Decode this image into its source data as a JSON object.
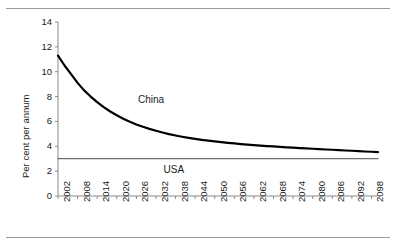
{
  "chart_data": {
    "type": "line",
    "title": "",
    "xlabel": "",
    "ylabel": "Per cent per annum",
    "xlim": [
      2002,
      2100
    ],
    "ylim": [
      0,
      14
    ],
    "yticks": [
      0,
      2,
      4,
      6,
      8,
      10,
      12,
      14
    ],
    "ytick_labels": [
      "0",
      "2",
      "4",
      "6",
      "8",
      "10",
      "12",
      "14"
    ],
    "xticks": [
      2002,
      2008,
      2014,
      2020,
      2026,
      2032,
      2038,
      2044,
      2050,
      2056,
      2062,
      2068,
      2074,
      2080,
      2086,
      2092,
      2098
    ],
    "xtick_labels": [
      "2002",
      "2008",
      "2014",
      "2020",
      "2026",
      "2032",
      "2038",
      "2044",
      "2050",
      "2056",
      "2062",
      "2068",
      "2074",
      "2080",
      "2086",
      "2092",
      "2098"
    ],
    "grid": false,
    "legend_position": "inline-annotations",
    "series": [
      {
        "name": "China",
        "color": "#000000",
        "line_width": 2.2,
        "label_position": {
          "x": 2032,
          "y": 6.6
        },
        "x": [
          2002,
          2004,
          2006,
          2008,
          2010,
          2012,
          2014,
          2016,
          2018,
          2020,
          2022,
          2024,
          2026,
          2028,
          2030,
          2032,
          2034,
          2036,
          2038,
          2040,
          2042,
          2044,
          2046,
          2048,
          2050,
          2052,
          2054,
          2056,
          2058,
          2060,
          2062,
          2064,
          2066,
          2068,
          2070,
          2072,
          2074,
          2076,
          2078,
          2080,
          2082,
          2084,
          2086,
          2088,
          2090,
          2092,
          2094,
          2096,
          2098,
          2100
        ],
        "values": [
          11.3,
          10.5,
          9.8,
          9.1,
          8.5,
          8.0,
          7.55,
          7.15,
          6.8,
          6.5,
          6.22,
          5.98,
          5.76,
          5.57,
          5.4,
          5.25,
          5.11,
          4.98,
          4.87,
          4.77,
          4.68,
          4.6,
          4.52,
          4.45,
          4.39,
          4.33,
          4.28,
          4.23,
          4.18,
          4.14,
          4.1,
          4.06,
          4.02,
          3.99,
          3.95,
          3.92,
          3.89,
          3.86,
          3.83,
          3.8,
          3.77,
          3.74,
          3.72,
          3.69,
          3.66,
          3.64,
          3.61,
          3.58,
          3.56,
          3.53
        ]
      },
      {
        "name": "USA",
        "color": "#6e6e6e",
        "line_width": 1.3,
        "label_position": {
          "x": 2038,
          "y": 2.1
        },
        "x": [
          2002,
          2100
        ],
        "values": [
          3.0,
          3.0
        ]
      }
    ]
  },
  "annotations": {
    "china_label": "China",
    "usa_label": "USA"
  },
  "axes": {
    "y_axis_title": "Per cent per annum"
  }
}
